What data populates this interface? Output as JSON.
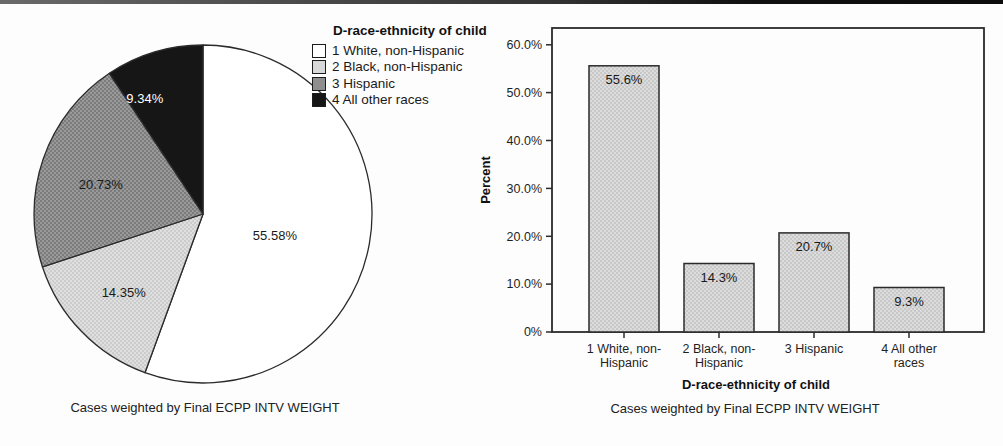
{
  "page": {
    "top_rule_color": "#1a1a1a",
    "text_color": "#1f1f1f",
    "outline_color": "#2b2b2b"
  },
  "chart_data": [
    {
      "type": "pie",
      "title": "D-race-ethnicity of child",
      "categories": [
        "1 White, non-Hispanic",
        "2 Black, non-Hispanic",
        "3 Hispanic",
        "4 All other races"
      ],
      "values": [
        55.58,
        14.35,
        20.73,
        9.34
      ],
      "slice_labels": [
        "55.58%",
        "14.35%",
        "20.73%",
        "9.34%"
      ],
      "colors": [
        "#ffffff",
        "#d8d8d8",
        "#8e8e8e",
        "#161616"
      ],
      "label_colors": [
        "#1a1a1a",
        "#1a1a1a",
        "#1a1a1a",
        "#ffffff"
      ],
      "legend_position": "top-right",
      "start_angle_deg": 0,
      "direction": "clockwise",
      "caption": "Cases weighted by Final ECPP INTV WEIGHT"
    },
    {
      "type": "bar",
      "categories": [
        "1 White, non-Hispanic",
        "2 Black, non-Hispanic",
        "3 Hispanic",
        "4 All other races"
      ],
      "values": [
        55.6,
        14.3,
        20.7,
        9.3
      ],
      "bar_labels": [
        "55.6%",
        "14.3%",
        "20.7%",
        "9.3%"
      ],
      "x_tick_lines": [
        [
          "1 White, non-",
          "Hispanic"
        ],
        [
          "2 Black, non-",
          "Hispanic"
        ],
        [
          "3 Hispanic"
        ],
        [
          "4 All other",
          "races"
        ]
      ],
      "xlabel": "D-race-ethnicity of child",
      "ylabel": "Percent",
      "y_ticks": [
        "0%",
        "10.0%",
        "20.0%",
        "30.0%",
        "40.0%",
        "50.0%",
        "60.0%"
      ],
      "y_tick_values": [
        0,
        10,
        20,
        30,
        40,
        50,
        60
      ],
      "ylim": [
        0,
        63.5
      ],
      "grid": false,
      "bar_color": "#d2d2d2",
      "outline_color": "#2b2b2b",
      "caption": "Cases weighted by Final ECPP INTV WEIGHT"
    }
  ]
}
